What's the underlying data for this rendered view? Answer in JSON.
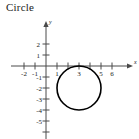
{
  "figure": {
    "title": "Circle",
    "background_color": "#ffffff",
    "ink_color": "#1a1a1a",
    "curve_color": "#000000"
  },
  "chart_data": {
    "type": "line",
    "title": "Circle",
    "xlabel": "x",
    "ylabel": "y",
    "grid": false,
    "legend": null,
    "xlim": [
      -2.6,
      7.2
    ],
    "ylim": [
      -6.0,
      2.6
    ],
    "x_ticks": [
      -2,
      -1,
      1,
      2,
      3,
      4,
      5,
      6
    ],
    "x_tick_labels": [
      "-2",
      "-1",
      "1",
      "",
      "3",
      "",
      "5",
      "6"
    ],
    "y_ticks": [
      2,
      1,
      -1,
      -2,
      -3,
      -4,
      -5
    ],
    "y_tick_labels": [
      "2",
      "1",
      "-1",
      "-2",
      "-3",
      "-4",
      "-5"
    ],
    "annotations": [],
    "series": [
      {
        "name": "circle",
        "shape": "circle",
        "center_x": 3,
        "center_y": -2,
        "radius": 2,
        "equation": "(x - 3)^2 + (y + 2)^2 = 4",
        "tangent_point_x": 3,
        "tangent_point_y": 0,
        "x_extent": [
          1,
          5
        ],
        "y_extent": [
          -4,
          0
        ],
        "stroke_width": 1.6,
        "closed": true,
        "filled": false
      }
    ]
  },
  "axes": {
    "x_axis_label": "x",
    "y_axis_label": "y",
    "origin_px": {
      "x": 46,
      "y": 66
    },
    "unit_px": 11,
    "x_arrow": true,
    "y_arrow": true
  },
  "labels": {
    "x_neg2": "-2",
    "x_neg1": "-1",
    "x_1": "1",
    "x_3": "3",
    "x_5": "5",
    "x_6": "6",
    "y_2": "2",
    "y_1": "1",
    "y_neg1": "-1",
    "y_neg2": "-2",
    "y_neg3": "-3",
    "y_neg4": "-4",
    "y_neg5": "-5"
  }
}
